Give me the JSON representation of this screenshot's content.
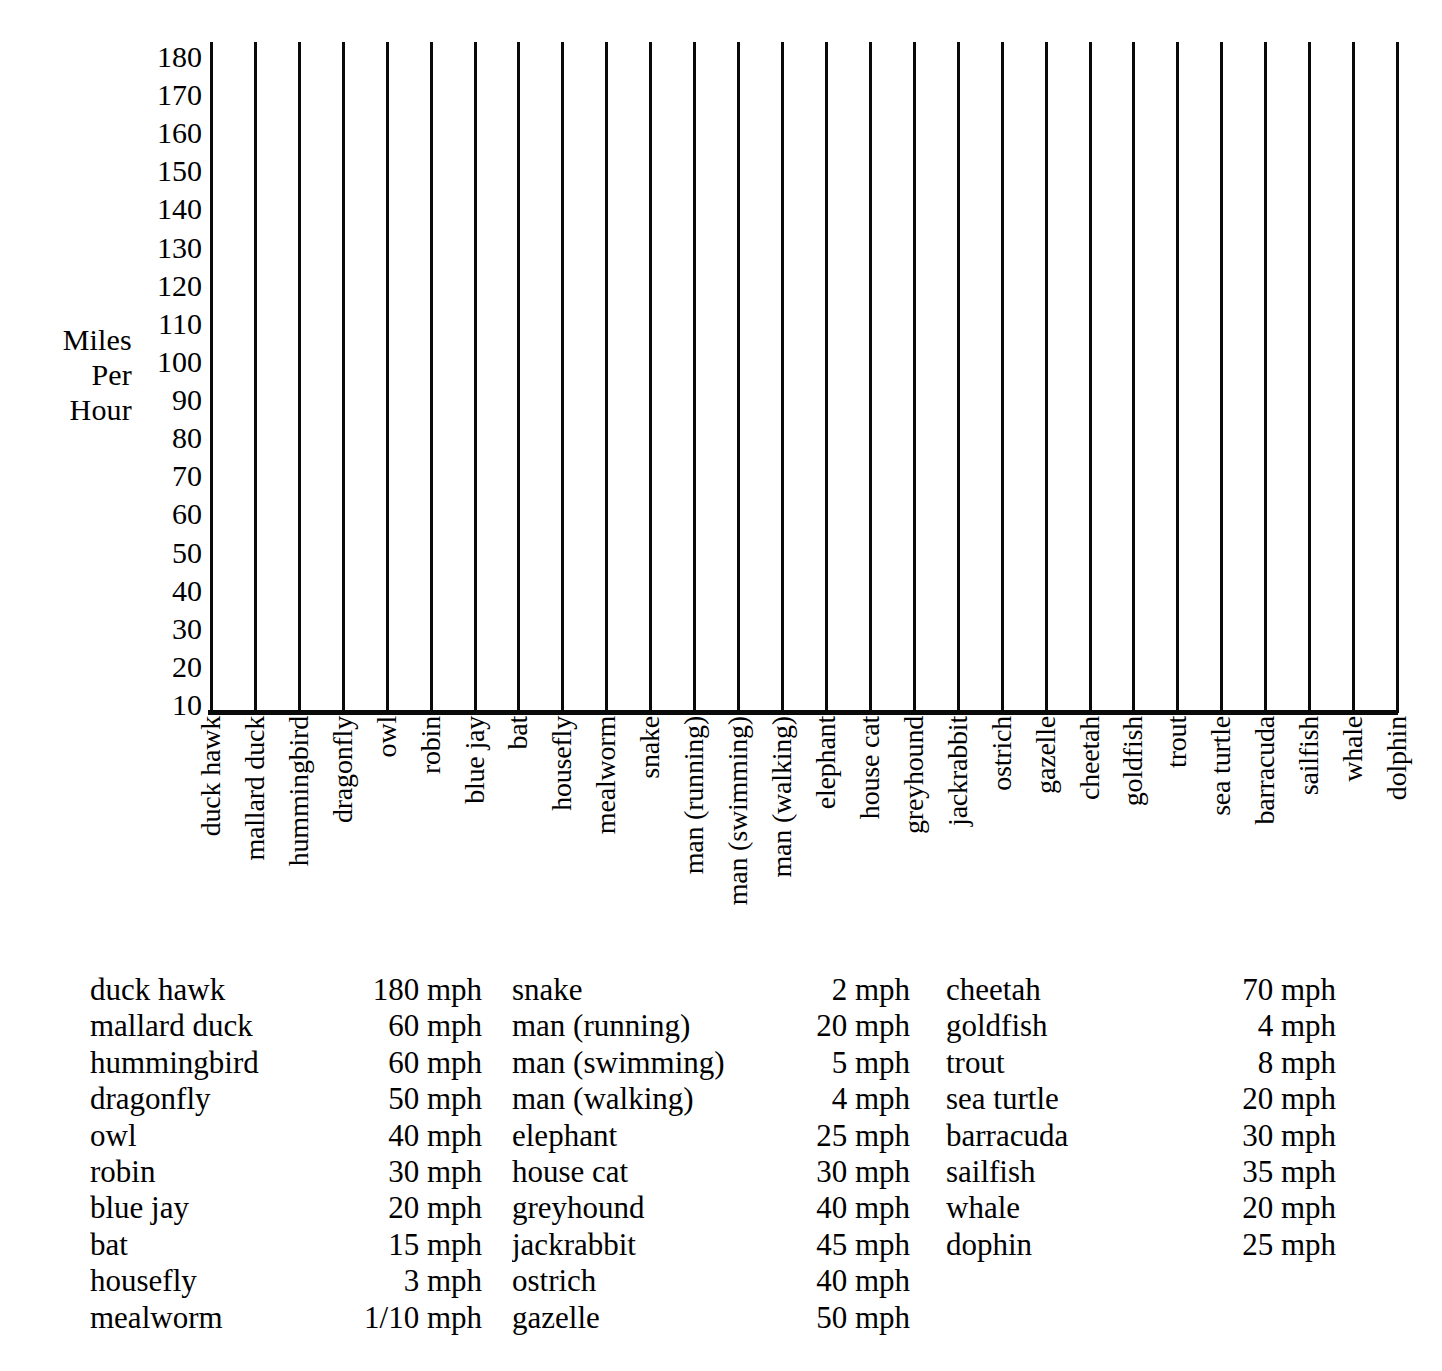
{
  "chart_data": {
    "type": "bar",
    "title": "",
    "subtitle": "",
    "xlabel": "",
    "ylabel": "Miles Per Hour",
    "ylabel_lines": [
      "Miles",
      "Per",
      "Hour"
    ],
    "ylim": [
      0,
      185
    ],
    "y_ticks": [
      180,
      170,
      160,
      150,
      140,
      130,
      120,
      110,
      100,
      90,
      80,
      70,
      60,
      50,
      40,
      30,
      20,
      10
    ],
    "grid": "vertical-only",
    "bars_drawn": false,
    "legend": "none",
    "unit": "mph",
    "categories": [
      "duck hawk",
      "mallard duck",
      "hummingbird",
      "dragonfly",
      "owl",
      "robin",
      "blue jay",
      "bat",
      "housefly",
      "mealworm",
      "snake",
      "man (running)",
      "man (swimming)",
      "man (walking)",
      "elephant",
      "house cat",
      "greyhound",
      "jackrabbit",
      "ostrich",
      "gazelle",
      "cheetah",
      "goldfish",
      "trout",
      "sea turtle",
      "barracuda",
      "sailfish",
      "whale",
      "dolphin"
    ],
    "values": [
      180,
      60,
      60,
      50,
      40,
      30,
      20,
      15,
      3,
      0.1,
      2,
      20,
      5,
      4,
      25,
      30,
      40,
      45,
      40,
      50,
      70,
      4,
      8,
      20,
      30,
      35,
      20,
      25
    ]
  },
  "axis": {
    "y_label_lines": [
      "Miles",
      "Per",
      "Hour"
    ],
    "y_ticks": [
      "180",
      "170",
      "160",
      "150",
      "140",
      "130",
      "120",
      "110",
      "100",
      "90",
      "80",
      "70",
      "60",
      "50",
      "40",
      "30",
      "20",
      "10"
    ],
    "x_categories": [
      "duck hawk",
      "mallard duck",
      "hummingbird",
      "dragonfly",
      "owl",
      "robin",
      "blue jay",
      "bat",
      "housefly",
      "mealworm",
      "snake",
      "man (running)",
      "man (swimming)",
      "man (walking)",
      "elephant",
      "house cat",
      "greyhound",
      "jackrabbit",
      "ostrich",
      "gazelle",
      "cheetah",
      "goldfish",
      "trout",
      "sea turtle",
      "barracuda",
      "sailfish",
      "whale",
      "dolphin"
    ]
  },
  "table": {
    "columns": [
      {
        "rows": [
          {
            "name": "duck hawk",
            "value": "180 mph"
          },
          {
            "name": "mallard duck",
            "value": "60 mph"
          },
          {
            "name": "hummingbird",
            "value": "60 mph"
          },
          {
            "name": "dragonfly",
            "value": "50 mph"
          },
          {
            "name": "owl",
            "value": "40 mph"
          },
          {
            "name": "robin",
            "value": "30 mph"
          },
          {
            "name": "blue jay",
            "value": "20 mph"
          },
          {
            "name": "bat",
            "value": "15 mph"
          },
          {
            "name": "housefly",
            "value": "3 mph"
          },
          {
            "name": "mealworm",
            "value": "1/10 mph"
          }
        ]
      },
      {
        "rows": [
          {
            "name": "snake",
            "value": "2 mph"
          },
          {
            "name": "man (running)",
            "value": "20 mph"
          },
          {
            "name": "man (swimming)",
            "value": "5 mph"
          },
          {
            "name": "man (walking)",
            "value": "4 mph"
          },
          {
            "name": "elephant",
            "value": "25 mph"
          },
          {
            "name": "house cat",
            "value": "30 mph"
          },
          {
            "name": "greyhound",
            "value": "40 mph"
          },
          {
            "name": "jackrabbit",
            "value": "45 mph"
          },
          {
            "name": "ostrich",
            "value": "40 mph"
          },
          {
            "name": "gazelle",
            "value": "50 mph"
          }
        ]
      },
      {
        "rows": [
          {
            "name": "cheetah",
            "value": "70 mph"
          },
          {
            "name": "goldfish",
            "value": "4 mph"
          },
          {
            "name": "trout",
            "value": "8 mph"
          },
          {
            "name": "sea turtle",
            "value": "20 mph"
          },
          {
            "name": "barracuda",
            "value": "30 mph"
          },
          {
            "name": "sailfish",
            "value": "35 mph"
          },
          {
            "name": "whale",
            "value": "20 mph"
          },
          {
            "name": "dophin",
            "value": "25 mph"
          }
        ]
      }
    ]
  },
  "colors": {
    "ink": "#0a0a0a",
    "paper": "#ffffff"
  }
}
